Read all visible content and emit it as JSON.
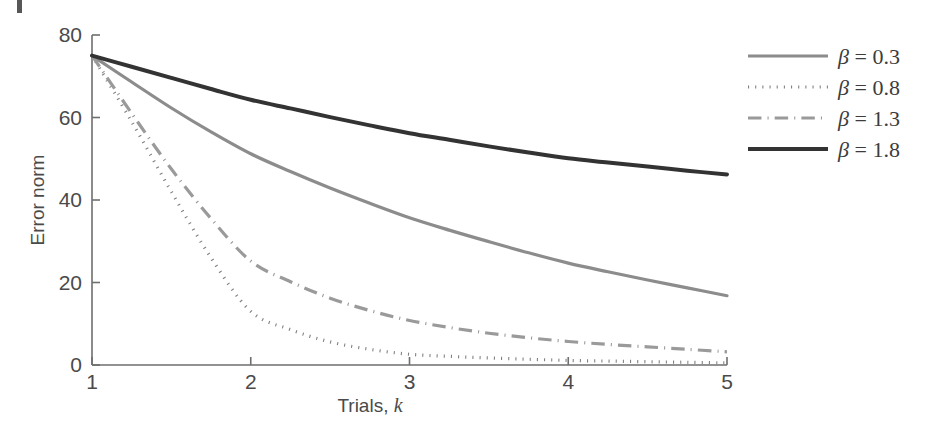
{
  "figure": {
    "background_color": "#ffffff",
    "axis_color": "#6e6e6e",
    "text_color": "#4a4a4a"
  },
  "axes": {
    "x_title_main": "Trials, ",
    "x_title_italic": "k",
    "y_title": "Error norm",
    "x_ticks": [
      "1",
      "2",
      "3",
      "4",
      "5"
    ],
    "y_ticks": [
      "0",
      "20",
      "40",
      "60",
      "80"
    ]
  },
  "legend": {
    "entries": [
      {
        "label": "β = 0.3",
        "beta": "β",
        "rest": " = 0.3",
        "style": "solid",
        "color": "#8c8c8c",
        "width": 3.2
      },
      {
        "label": "β = 0.8",
        "beta": "β",
        "rest": " = 0.8",
        "style": "dotted",
        "color": "#808080",
        "width": 3.2
      },
      {
        "label": "β = 1.3",
        "beta": "β",
        "rest": " = 1.3",
        "style": "dashdot",
        "color": "#9a9a9a",
        "width": 3.2
      },
      {
        "label": "β = 1.8",
        "beta": "β",
        "rest": " = 1.8",
        "style": "solid",
        "color": "#333333",
        "width": 4.0
      }
    ]
  },
  "chart_data": {
    "type": "line",
    "title": "",
    "xlabel": "Trials, k",
    "ylabel": "Error norm",
    "xlim": [
      1,
      5
    ],
    "ylim": [
      0,
      80
    ],
    "xticks": [
      1,
      2,
      3,
      4,
      5
    ],
    "yticks": [
      0,
      20,
      40,
      60,
      80
    ],
    "grid": false,
    "legend_position": "right-outside",
    "x": [
      1,
      1.25,
      1.5,
      1.75,
      2,
      2.25,
      2.5,
      2.75,
      3,
      3.25,
      3.5,
      3.75,
      4,
      4.25,
      4.5,
      4.75,
      5
    ],
    "series": [
      {
        "name": "β = 0.3",
        "style": "solid",
        "color": "#8c8c8c",
        "width": 3.2,
        "values": [
          75.0,
          68.6,
          62.3,
          56.5,
          51.2,
          46.9,
          42.9,
          39.2,
          35.7,
          32.7,
          29.9,
          27.2,
          24.7,
          22.6,
          20.6,
          18.7,
          16.8
        ]
      },
      {
        "name": "β = 0.8",
        "style": "dotted",
        "color": "#808080",
        "width": 3.2,
        "values": [
          75.0,
          59.0,
          42.0,
          26.0,
          13.0,
          8.6,
          5.6,
          3.8,
          2.6,
          2.1,
          1.7,
          1.4,
          1.1,
          0.95,
          0.8,
          0.65,
          0.5
        ]
      },
      {
        "name": "β = 1.3",
        "style": "dashdot",
        "color": "#9a9a9a",
        "width": 3.2,
        "values": [
          75.0,
          61.0,
          47.5,
          35.5,
          25.2,
          20.2,
          16.2,
          13.2,
          10.8,
          9.1,
          7.7,
          6.6,
          5.7,
          5.0,
          4.4,
          3.8,
          3.2
        ]
      },
      {
        "name": "β = 1.8",
        "style": "solid",
        "color": "#333333",
        "width": 4.0,
        "values": [
          75.0,
          72.3,
          69.6,
          66.9,
          64.3,
          62.2,
          60.1,
          58.1,
          56.2,
          54.6,
          53.0,
          51.5,
          50.1,
          49.1,
          48.1,
          47.1,
          46.2
        ]
      }
    ]
  }
}
